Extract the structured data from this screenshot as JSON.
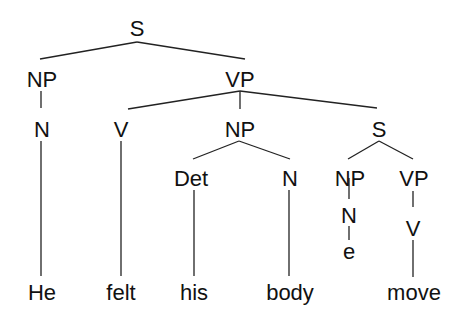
{
  "diagram": {
    "type": "syntax-tree",
    "sentence": [
      "He",
      "felt",
      "his",
      "body",
      "move"
    ],
    "nodes": {
      "s_root": "S",
      "np_subj": "NP",
      "vp_main": "VP",
      "n_he": "N",
      "v_felt": "V",
      "np_obj": "NP",
      "s_emb": "S",
      "det": "Det",
      "n_body": "N",
      "np_emb": "NP",
      "vp_emb": "VP",
      "n_empty": "N",
      "v_move": "V",
      "empty": "e"
    },
    "words": {
      "he": "He",
      "felt": "felt",
      "his": "his",
      "body": "body",
      "move": "move"
    },
    "edges": [
      [
        "S",
        "NP"
      ],
      [
        "S",
        "VP"
      ],
      [
        "NP",
        "N"
      ],
      [
        "N",
        "He"
      ],
      [
        "VP",
        "V"
      ],
      [
        "VP",
        "NP"
      ],
      [
        "VP",
        "S"
      ],
      [
        "V",
        "felt"
      ],
      [
        "NP",
        "Det"
      ],
      [
        "NP",
        "N"
      ],
      [
        "Det",
        "his"
      ],
      [
        "N",
        "body"
      ],
      [
        "S",
        "NP"
      ],
      [
        "S",
        "VP"
      ],
      [
        "NP",
        "N"
      ],
      [
        "N",
        "e"
      ],
      [
        "VP",
        "V"
      ],
      [
        "V",
        "move"
      ]
    ]
  }
}
